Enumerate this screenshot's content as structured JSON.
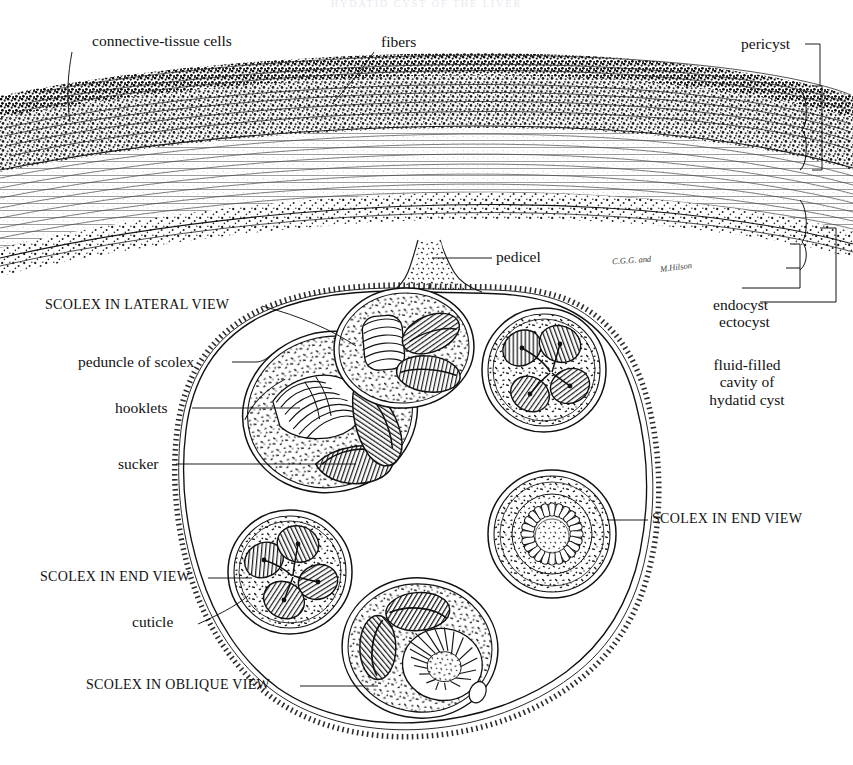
{
  "plate": {
    "title": "HYDATID CYST OF THE LIVER",
    "signature_primary": "C.G.G. and",
    "signature_secondary": "M.Hilson"
  },
  "labels": {
    "connective_tissue_cells": "connective-tissue cells",
    "fibers": "fibers",
    "pericyst": "pericyst",
    "pedicel": "pedicel",
    "endocyst": "endocyst",
    "ectocyst": "ectocyst",
    "scolex_lateral": "SCOLEX IN LATERAL VIEW",
    "peduncle_of_scolex": "peduncle of scolex",
    "hooklets": "hooklets",
    "sucker": "sucker",
    "fluid_cavity_line1": "fluid-filled",
    "fluid_cavity_line2": "cavity of",
    "fluid_cavity_line3": "hydatid cyst",
    "scolex_end_right": "SCOLEX IN END VIEW",
    "scolex_end_left": "SCOLEX IN END VIEW",
    "cuticle": "cuticle",
    "scolex_oblique": "SCOLEX IN OBLIQUE VIEW"
  },
  "colors": {
    "ink": "#111111",
    "paper": "#ffffff",
    "stipple_dense": "#1a1a1a",
    "stipple_light": "#2b2b2b",
    "lamina": "#444444"
  },
  "structures": {
    "wall_layers": [
      {
        "name": "pericyst",
        "texture": "dense-stipple",
        "description": "fibrous connective-tissue capsule with cells and fibers"
      },
      {
        "name": "ectocyst",
        "texture": "laminated-lines",
        "description": "laminated acellular membrane"
      },
      {
        "name": "endocyst",
        "texture": "fine-dots",
        "description": "germinal layer"
      }
    ],
    "brood_capsules": [
      {
        "id": "lateral",
        "view": "lateral",
        "cx": 330,
        "cy": 410,
        "rx": 85,
        "ry": 78,
        "rot": -18
      },
      {
        "id": "upper-mid",
        "view": "lateral-partial",
        "cx": 400,
        "cy": 345,
        "rx": 62,
        "ry": 52,
        "rot": -6
      },
      {
        "id": "upper-right",
        "view": "end",
        "cx": 540,
        "cy": 368,
        "rx": 58,
        "ry": 56,
        "rot": 0
      },
      {
        "id": "right-end",
        "view": "end",
        "cx": 552,
        "cy": 532,
        "rx": 60,
        "ry": 58,
        "rot": 0
      },
      {
        "id": "lower-left",
        "view": "end",
        "cx": 288,
        "cy": 570,
        "rx": 58,
        "ry": 57,
        "rot": 0
      },
      {
        "id": "lower-mid",
        "view": "oblique",
        "cx": 418,
        "cy": 645,
        "rx": 72,
        "ry": 64,
        "rot": 8
      }
    ],
    "sucker_count_per_scolex": 4
  }
}
